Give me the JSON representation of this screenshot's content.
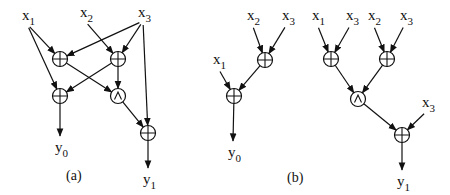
{
  "figure": {
    "panels": [
      {
        "id": "a",
        "caption": "(a)",
        "caption_pos": [
          75,
          180
        ],
        "inputs": [
          {
            "id": "a_x1",
            "name": "x",
            "sub": "1",
            "pos": [
              27,
              18
            ]
          },
          {
            "id": "a_x2",
            "name": "x",
            "sub": "2",
            "pos": [
              85,
              15
            ]
          },
          {
            "id": "a_x3",
            "name": "x",
            "sub": "3",
            "pos": [
              143,
              15
            ]
          }
        ],
        "gates": [
          {
            "id": "a_g1",
            "op": "xor",
            "pos": [
              60,
              59
            ]
          },
          {
            "id": "a_g2",
            "op": "xor",
            "pos": [
              118,
              59
            ]
          },
          {
            "id": "a_g3",
            "op": "xor",
            "pos": [
              60,
              96
            ]
          },
          {
            "id": "a_g4",
            "op": "and",
            "pos": [
              118,
              96
            ]
          },
          {
            "id": "a_g5",
            "op": "xor",
            "pos": [
              148,
              133
            ]
          }
        ],
        "outputs": [
          {
            "id": "a_y0",
            "name": "y",
            "sub": "0",
            "pos": [
              60,
              150
            ]
          },
          {
            "id": "a_y1",
            "name": "y",
            "sub": "1",
            "pos": [
              148,
              182
            ]
          }
        ],
        "edges": [
          [
            "a_x1",
            "a_g1"
          ],
          [
            "a_x1",
            "a_g3"
          ],
          [
            "a_x2",
            "a_g2"
          ],
          [
            "a_x3",
            "a_g1"
          ],
          [
            "a_x3",
            "a_g2"
          ],
          [
            "a_x3",
            "a_g5"
          ],
          [
            "a_g1",
            "a_g4"
          ],
          [
            "a_g2",
            "a_g3"
          ],
          [
            "a_g2",
            "a_g4"
          ],
          [
            "a_g3",
            "a_y0"
          ],
          [
            "a_g4",
            "a_g5"
          ],
          [
            "a_g5",
            "a_y1"
          ]
        ]
      },
      {
        "id": "b",
        "caption": "(b)",
        "caption_pos": [
          296,
          182
        ],
        "inputs": [
          {
            "id": "b_x1a",
            "name": "x",
            "sub": "1",
            "pos": [
              218,
              62
            ]
          },
          {
            "id": "b_x2a",
            "name": "x",
            "sub": "2",
            "pos": [
              252,
              18
            ]
          },
          {
            "id": "b_x3a",
            "name": "x",
            "sub": "3",
            "pos": [
              287,
              18
            ]
          },
          {
            "id": "b_x1b",
            "name": "x",
            "sub": "1",
            "pos": [
              317,
              18
            ]
          },
          {
            "id": "b_x3b",
            "name": "x",
            "sub": "3",
            "pos": [
              351,
              18
            ]
          },
          {
            "id": "b_x2b",
            "name": "x",
            "sub": "2",
            "pos": [
              373,
              18
            ]
          },
          {
            "id": "b_x3c",
            "name": "x",
            "sub": "3",
            "pos": [
              405,
              18
            ]
          },
          {
            "id": "b_x3d",
            "name": "x",
            "sub": "3",
            "pos": [
              427,
              105
            ]
          }
        ],
        "gates": [
          {
            "id": "b_g1",
            "op": "xor",
            "pos": [
              265,
              60
            ]
          },
          {
            "id": "b_g2",
            "op": "xor",
            "pos": [
              234,
              96
            ]
          },
          {
            "id": "b_g3",
            "op": "xor",
            "pos": [
              331,
              59
            ]
          },
          {
            "id": "b_g4",
            "op": "xor",
            "pos": [
              387,
              59
            ]
          },
          {
            "id": "b_g5",
            "op": "and",
            "pos": [
              358,
              99
            ]
          },
          {
            "id": "b_g6",
            "op": "xor",
            "pos": [
              402,
              135
            ]
          }
        ],
        "outputs": [
          {
            "id": "b_y0",
            "name": "y",
            "sub": "0",
            "pos": [
              233,
              155
            ]
          },
          {
            "id": "b_y1",
            "name": "y",
            "sub": "1",
            "pos": [
              402,
              184
            ]
          }
        ],
        "edges": [
          [
            "b_x2a",
            "b_g1"
          ],
          [
            "b_x3a",
            "b_g1"
          ],
          [
            "b_x1a",
            "b_g2"
          ],
          [
            "b_g1",
            "b_g2"
          ],
          [
            "b_g2",
            "b_y0"
          ],
          [
            "b_x1b",
            "b_g3"
          ],
          [
            "b_x3b",
            "b_g3"
          ],
          [
            "b_x2b",
            "b_g4"
          ],
          [
            "b_x3c",
            "b_g4"
          ],
          [
            "b_g3",
            "b_g5"
          ],
          [
            "b_g4",
            "b_g5"
          ],
          [
            "b_g5",
            "b_g6"
          ],
          [
            "b_x3d",
            "b_g6"
          ],
          [
            "b_g6",
            "b_y1"
          ]
        ]
      }
    ]
  }
}
